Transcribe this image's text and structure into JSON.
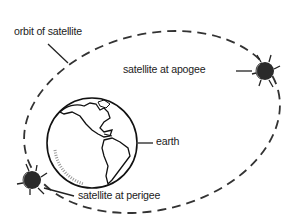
{
  "diagram": {
    "type": "orbit-diagram",
    "labels": {
      "orbit": "orbit of satellite",
      "apogee": "satellite at apogee",
      "earth": "earth",
      "perigee": "satellite at perigee"
    },
    "elements": {
      "orbit": {
        "shape": "dashed-ellipse",
        "stroke": "#333333"
      },
      "earth": {
        "shape": "globe",
        "shows": "Americas"
      },
      "satellite_apogee": {
        "position": "right, farthest from earth"
      },
      "satellite_perigee": {
        "position": "lower-left, nearest to earth"
      }
    },
    "colors": {
      "ink": "#222222",
      "background": "#ffffff",
      "satellite_fill": "#2a2a2a"
    }
  }
}
